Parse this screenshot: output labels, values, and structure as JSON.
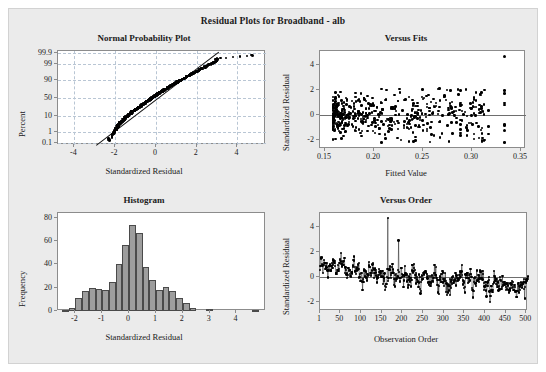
{
  "figure": {
    "title": "Residual Plots for Broadband - alb",
    "background": "#ebebeb",
    "plot_background": "#ffffff",
    "grid_color": "#b9c6d4",
    "marker_color": "#000000",
    "bar_fill": "#9d9d9d",
    "bar_edge": "#4a4a4a"
  },
  "chart_data": [
    {
      "type": "scatter",
      "name": "normal-probability-plot",
      "title": "Normal Probability Plot",
      "xlabel": "Standardized Residual",
      "ylabel": "Percent",
      "xlim": [
        -4.8,
        5.4
      ],
      "xticks": [
        -4,
        -2,
        0,
        2,
        4
      ],
      "xticklabels": [
        "-4",
        "-2",
        "0",
        "2",
        "4"
      ],
      "yticks": [
        0.1,
        1,
        10,
        50,
        90,
        99,
        99.9
      ],
      "yticklabels": [
        "0.1",
        "1",
        "10",
        "50",
        "90",
        "99",
        "99.9"
      ],
      "yscale": "normal-probability",
      "grid": true,
      "reference_line": {
        "x1": -2.95,
        "y1": 0.06,
        "x2": 3.05,
        "y2": 99.94
      },
      "n": 504,
      "points": [
        [
          -2.28,
          0.18
        ],
        [
          -2.12,
          0.5
        ],
        [
          -2.05,
          0.8
        ],
        [
          -2.0,
          1.1
        ],
        [
          -1.96,
          1.5
        ],
        [
          -1.93,
          1.9
        ],
        [
          -1.9,
          2.3
        ],
        [
          -1.86,
          2.8
        ],
        [
          -1.82,
          3.3
        ],
        [
          -1.78,
          3.9
        ],
        [
          -1.74,
          4.4
        ],
        [
          -1.7,
          5.0
        ],
        [
          -1.66,
          5.6
        ],
        [
          -1.62,
          6.3
        ],
        [
          -1.58,
          7.0
        ],
        [
          -1.54,
          7.8
        ],
        [
          -1.5,
          8.6
        ],
        [
          -1.46,
          9.4
        ],
        [
          -1.42,
          10.3
        ],
        [
          -1.38,
          11.2
        ],
        [
          -1.33,
          12.2
        ],
        [
          -1.29,
          13.2
        ],
        [
          -1.25,
          14.2
        ],
        [
          -1.21,
          15.3
        ],
        [
          -1.17,
          16.4
        ],
        [
          -1.12,
          17.6
        ],
        [
          -1.08,
          18.8
        ],
        [
          -1.04,
          20.0
        ],
        [
          -1.0,
          21.3
        ],
        [
          -0.96,
          22.6
        ],
        [
          -0.91,
          24.0
        ],
        [
          -0.87,
          25.4
        ],
        [
          -0.83,
          26.8
        ],
        [
          -0.78,
          28.3
        ],
        [
          -0.74,
          29.8
        ],
        [
          -0.7,
          31.3
        ],
        [
          -0.65,
          32.9
        ],
        [
          -0.61,
          34.5
        ],
        [
          -0.56,
          36.1
        ],
        [
          -0.52,
          37.8
        ],
        [
          -0.47,
          39.5
        ],
        [
          -0.43,
          41.2
        ],
        [
          -0.38,
          42.9
        ],
        [
          -0.33,
          44.7
        ],
        [
          -0.29,
          46.5
        ],
        [
          -0.24,
          48.3
        ],
        [
          -0.19,
          50.1
        ],
        [
          -0.14,
          52.0
        ],
        [
          -0.09,
          53.8
        ],
        [
          -0.04,
          55.7
        ],
        [
          0.01,
          57.6
        ],
        [
          0.06,
          59.4
        ],
        [
          0.11,
          61.3
        ],
        [
          0.16,
          63.1
        ],
        [
          0.22,
          65.0
        ],
        [
          0.27,
          66.8
        ],
        [
          0.33,
          68.6
        ],
        [
          0.38,
          70.3
        ],
        [
          0.44,
          72.1
        ],
        [
          0.5,
          73.8
        ],
        [
          0.56,
          75.4
        ],
        [
          0.62,
          77.0
        ],
        [
          0.68,
          78.6
        ],
        [
          0.74,
          80.1
        ],
        [
          0.8,
          81.6
        ],
        [
          0.87,
          83.0
        ],
        [
          0.93,
          84.3
        ],
        [
          1.0,
          85.6
        ],
        [
          1.07,
          86.9
        ],
        [
          1.14,
          88.0
        ],
        [
          1.21,
          89.2
        ],
        [
          1.28,
          90.2
        ],
        [
          1.36,
          91.2
        ],
        [
          1.43,
          92.1
        ],
        [
          1.51,
          93.0
        ],
        [
          1.59,
          93.8
        ],
        [
          1.67,
          94.6
        ],
        [
          1.76,
          95.3
        ],
        [
          1.85,
          95.9
        ],
        [
          1.94,
          96.5
        ],
        [
          2.04,
          97.0
        ],
        [
          2.14,
          97.5
        ],
        [
          2.25,
          97.9
        ],
        [
          2.36,
          98.3
        ],
        [
          2.48,
          98.6
        ],
        [
          2.61,
          98.9
        ],
        [
          2.72,
          99.1
        ],
        [
          2.78,
          99.3
        ],
        [
          2.9,
          99.45
        ],
        [
          2.97,
          99.6
        ],
        [
          3.0,
          99.7
        ],
        [
          4.72,
          99.85
        ]
      ]
    },
    {
      "type": "scatter",
      "name": "versus-fits",
      "title": "Versus Fits",
      "xlabel": "Fitted Value",
      "ylabel": "Standardized Residual",
      "xlim": [
        0.145,
        0.355
      ],
      "ylim": [
        -2.7,
        5.1
      ],
      "xticks": [
        0.15,
        0.2,
        0.25,
        0.3,
        0.35
      ],
      "xticklabels": [
        "0.15",
        "0.20",
        "0.25",
        "0.30",
        "0.35"
      ],
      "yticks": [
        -2,
        0,
        2,
        4
      ],
      "yticklabels": [
        "-2",
        "0",
        "2",
        "4"
      ],
      "grid": false,
      "zero_line": 0,
      "n": 504,
      "note": "Dense fan-shaped residual cloud, spread widens slightly at higher fitted values; one extreme outlier near (0.333, 4.7)."
    },
    {
      "type": "bar",
      "name": "histogram",
      "title": "Histogram",
      "xlabel": "Standardized Residual",
      "ylabel": "Frequency",
      "xlim": [
        -2.65,
        5.1
      ],
      "ylim": [
        0,
        84
      ],
      "xticks": [
        -2,
        -1,
        0,
        1,
        2,
        3,
        4
      ],
      "xticklabels": [
        "-2",
        "-1",
        "0",
        "1",
        "2",
        "3",
        "4"
      ],
      "yticks": [
        0,
        20,
        40,
        60,
        80
      ],
      "yticklabels": [
        "0",
        "20",
        "40",
        "60",
        "80"
      ],
      "bin_width": 0.25,
      "bin_centers": [
        -2.375,
        -2.125,
        -1.875,
        -1.625,
        -1.375,
        -1.125,
        -0.875,
        -0.625,
        -0.375,
        -0.125,
        0.125,
        0.375,
        0.625,
        0.875,
        1.125,
        1.375,
        1.625,
        1.875,
        2.125,
        2.375,
        3.0,
        4.72
      ],
      "values": [
        1,
        3,
        11,
        17,
        20,
        19,
        18,
        25,
        40,
        57,
        74,
        67,
        38,
        27,
        18,
        21,
        17,
        11,
        7,
        3,
        2,
        1
      ]
    },
    {
      "type": "line",
      "name": "versus-order",
      "title": "Versus Order",
      "xlabel": "Observation Order",
      "ylabel": "Standardized Residual",
      "xlim": [
        1,
        504
      ],
      "ylim": [
        -2.7,
        5.1
      ],
      "xticks": [
        1,
        50,
        100,
        150,
        200,
        250,
        300,
        350,
        400,
        450,
        500
      ],
      "xticklabels": [
        "1",
        "50",
        "100",
        "150",
        "200",
        "250",
        "300",
        "350",
        "400",
        "450",
        "500"
      ],
      "yticks": [
        -2,
        0,
        2,
        4
      ],
      "yticklabels": [
        "-2",
        "0",
        "2",
        "4"
      ],
      "grid": false,
      "zero_line": 0,
      "n": 504,
      "note": "Connected-dot series oscillating about zero; positive drift early (obs 1-230), spike to 4.7 near obs 165, negative drift late (obs 350-504)."
    }
  ]
}
